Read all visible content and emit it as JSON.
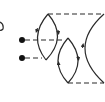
{
  "diagram": {
    "type": "feynman-loop-diagram",
    "stroke_color": "#2a2a2a",
    "background": "#ffffff",
    "vertices": [
      {
        "name": "external-vertex-1",
        "x": 22,
        "y": 40
      },
      {
        "name": "external-vertex-2",
        "x": 22,
        "y": 58
      }
    ],
    "loops": [
      "left-lens-loop",
      "middle-lens-loop",
      "right-arc"
    ],
    "dashed_lines": [
      "top-dashed-line",
      "bottom-dashed-line",
      "vertex1-dashed-line",
      "vertex2-dashed-line"
    ]
  }
}
